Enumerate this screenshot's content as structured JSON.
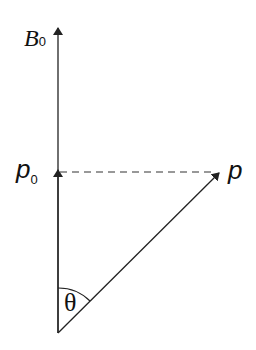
{
  "diagram": {
    "labels": {
      "b0_main": "B",
      "b0_sub": "0",
      "p0_main": "p",
      "p0_sub": "0",
      "p": "p",
      "theta": "θ"
    },
    "colors": {
      "line": "#222222",
      "background": "#ffffff"
    }
  }
}
